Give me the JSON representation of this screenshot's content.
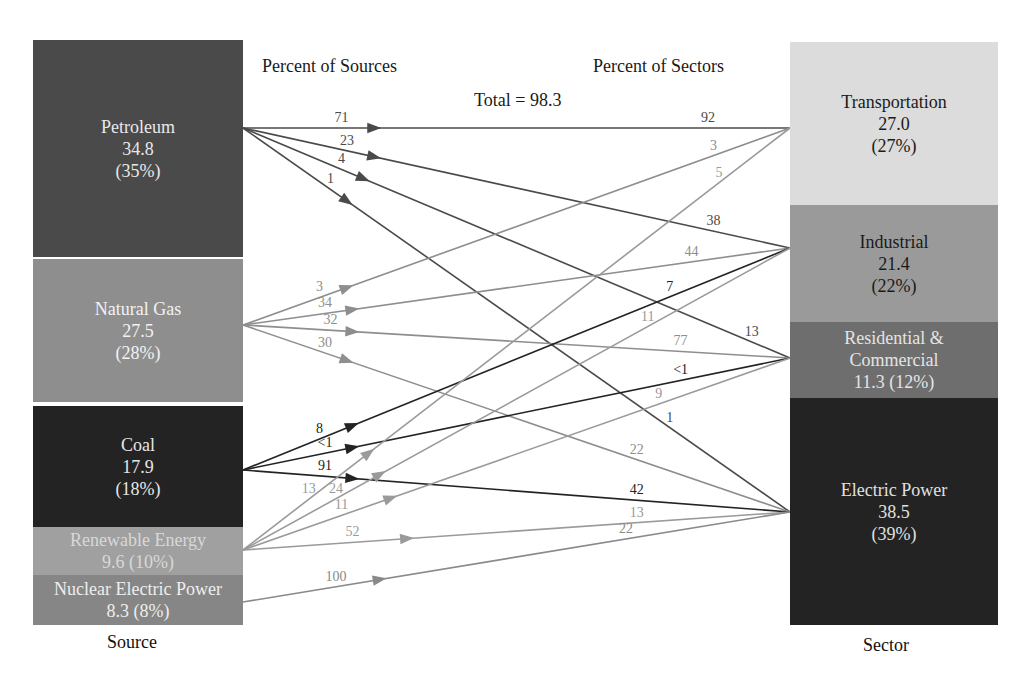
{
  "headings": {
    "percent_of_sources": "Percent of Sources",
    "percent_of_sectors": "Percent of Sectors",
    "total": "Total = 98.3"
  },
  "axis": {
    "source_label": "Source",
    "sector_label": "Sector"
  },
  "sources": [
    {
      "id": "petroleum",
      "name": "Petroleum",
      "value": "34.8",
      "percent": "(35%)",
      "lines": [
        "Petroleum",
        "34.8",
        "(35%)"
      ],
      "color": "#4a4a4a",
      "text_color": "#e8e8e8",
      "top": 40,
      "height": 217,
      "anchor_y": 128
    },
    {
      "id": "natural-gas",
      "name": "Natural Gas",
      "value": "27.5",
      "percent": "(28%)",
      "lines": [
        "Natural Gas",
        "27.5",
        "(28%)"
      ],
      "color": "#8e8e8e",
      "text_color": "#f2f2f2",
      "top": 259,
      "height": 143,
      "anchor_y": 325
    },
    {
      "id": "coal",
      "name": "Coal",
      "value": "17.9",
      "percent": "(18%)",
      "lines": [
        "Coal",
        "17.9",
        "(18%)"
      ],
      "color": "#232323",
      "text_color": "#e6e6e6",
      "top": 406,
      "height": 121,
      "anchor_y": 470
    },
    {
      "id": "renewable-energy",
      "name": "Renewable Energy",
      "value": "9.6",
      "percent": "(10%)",
      "lines": [
        "Renewable Energy",
        "9.6 (10%)"
      ],
      "color": "#a0a0a0",
      "text_color": "#d8d8d8",
      "top": 527,
      "height": 48,
      "anchor_y": 550
    },
    {
      "id": "nuclear-electric-power",
      "name": "Nuclear Electric Power",
      "value": "8.3",
      "percent": "(8%)",
      "lines": [
        "Nuclear Electric Power",
        "8.3 (8%)"
      ],
      "color": "#868686",
      "text_color": "#eeeeee",
      "top": 575,
      "height": 50,
      "anchor_y": 602
    }
  ],
  "sectors": [
    {
      "id": "transportation",
      "name": "Transportation",
      "value": "27.0",
      "percent": "(27%)",
      "lines": [
        "Transportation",
        "27.0",
        "(27%)"
      ],
      "color": "#dcdcdc",
      "text_color": "#1a1a1a",
      "top": 42,
      "height": 163,
      "anchor_y": 128
    },
    {
      "id": "industrial",
      "name": "Industrial",
      "value": "21.4",
      "percent": "(22%)",
      "lines": [
        "Industrial",
        "21.4",
        "(22%)"
      ],
      "color": "#9a9a9a",
      "text_color": "#1a1a1a",
      "top": 205,
      "height": 117,
      "anchor_y": 248
    },
    {
      "id": "residential-commercial",
      "name": "Residential & Commercial",
      "value": "11.3",
      "percent": "(12%)",
      "lines": [
        "Residential &",
        "Commercial",
        "11.3 (12%)"
      ],
      "color": "#6e6e6e",
      "text_color": "#e4e4e4",
      "top": 322,
      "height": 76,
      "anchor_y": 358
    },
    {
      "id": "electric-power",
      "name": "Electric Power",
      "value": "38.5",
      "percent": "(39%)",
      "lines": [
        "Electric Power",
        "38.5",
        "(39%)"
      ],
      "color": "#232323",
      "text_color": "#e0e0e0",
      "top": 398,
      "height": 227,
      "anchor_y": 512
    }
  ],
  "flows": [
    {
      "from": "petroleum",
      "to": "transportation",
      "pct_source": "71",
      "pct_sector": "92",
      "color": "#4a4a4a",
      "label_color": "#4a4a4a",
      "arrow_t": 0.24,
      "src_label_t": 0.18,
      "sec_label_t": 0.85
    },
    {
      "from": "petroleum",
      "to": "industrial",
      "pct_source": "23",
      "pct_sector": "38",
      "color": "#4a4a4a",
      "label_color": "#4a4a4a",
      "arrow_t": 0.24,
      "src_label_t": 0.19,
      "sec_label_t": 0.86
    },
    {
      "from": "petroleum",
      "to": "residential-commercial",
      "pct_source": "4",
      "pct_sector": "13",
      "color": "#4a4a4a",
      "label_color": "#4a4a4a",
      "arrow_t": 0.22,
      "src_label_t": 0.18,
      "sec_label_t": 0.93
    },
    {
      "from": "petroleum",
      "to": "electric-power",
      "pct_source": "1",
      "pct_sector": "1",
      "color": "#4a4a4a",
      "label_color": "#4a4a4a",
      "arrow_t": 0.19,
      "src_label_t": 0.16,
      "sec_label_t": 0.78
    },
    {
      "from": "natural-gas",
      "to": "transportation",
      "pct_source": "3",
      "pct_sector": "3",
      "color": "#8e8e8e",
      "label_color": "#8e8e8e",
      "arrow_t": 0.19,
      "src_label_t": 0.14,
      "sec_label_t": 0.86
    },
    {
      "from": "natural-gas",
      "to": "industrial",
      "pct_source": "34",
      "pct_sector": "44",
      "color": "#8e8e8e",
      "label_color": "#8e8e8e",
      "arrow_t": 0.2,
      "src_label_t": 0.15,
      "sec_label_t": 0.82
    },
    {
      "from": "natural-gas",
      "to": "residential-commercial",
      "pct_source": "32",
      "pct_sector": "77",
      "color": "#8e8e8e",
      "label_color": "#8e8e8e",
      "arrow_t": 0.2,
      "src_label_t": 0.16,
      "sec_label_t": 0.8
    },
    {
      "from": "natural-gas",
      "to": "electric-power",
      "pct_source": "30",
      "pct_sector": "22",
      "color": "#8e8e8e",
      "label_color": "#8e8e8e",
      "arrow_t": 0.19,
      "src_label_t": 0.15,
      "sec_label_t": 0.72
    },
    {
      "from": "coal",
      "to": "industrial",
      "pct_source": "8",
      "pct_sector": "7",
      "color": "#232323",
      "label_color": "#232323",
      "arrow_t": 0.2,
      "src_label_t": 0.14,
      "sec_label_t": 0.78
    },
    {
      "from": "coal",
      "to": "residential-commercial",
      "pct_source": "<1",
      "pct_sector": "<1",
      "color": "#232323",
      "label_color": "#232323",
      "arrow_t": 0.2,
      "src_label_t": 0.15,
      "sec_label_t": 0.8
    },
    {
      "from": "coal",
      "to": "electric-power",
      "pct_source": "91",
      "pct_sector": "42",
      "color": "#232323",
      "label_color": "#232323",
      "arrow_t": 0.2,
      "src_label_t": 0.15,
      "sec_label_t": 0.72
    },
    {
      "from": "renewable-energy",
      "to": "transportation",
      "pct_source": "13",
      "pct_sector": "5",
      "color": "#9a9a9a",
      "label_color": "#9a9a9a",
      "arrow_t": 0.23,
      "src_label_t": 0.12,
      "sec_label_t": 0.87
    },
    {
      "from": "renewable-energy",
      "to": "industrial",
      "pct_source": "24",
      "pct_sector": "11",
      "color": "#9a9a9a",
      "label_color": "#9a9a9a",
      "arrow_t": 0.25,
      "src_label_t": 0.17,
      "sec_label_t": 0.74
    },
    {
      "from": "renewable-energy",
      "to": "residential-commercial",
      "pct_source": "11",
      "pct_sector": "9",
      "color": "#9a9a9a",
      "label_color": "#9a9a9a",
      "arrow_t": 0.27,
      "src_label_t": 0.18,
      "sec_label_t": 0.76
    },
    {
      "from": "renewable-energy",
      "to": "electric-power",
      "pct_source": "52",
      "pct_sector": "13",
      "color": "#9a9a9a",
      "label_color": "#9a9a9a",
      "arrow_t": 0.3,
      "src_label_t": 0.2,
      "sec_label_t": 0.72
    },
    {
      "from": "nuclear-electric-power",
      "to": "electric-power",
      "pct_source": "100",
      "pct_sector": "22",
      "color": "#8a8a8a",
      "label_color": "#8a8a8a",
      "arrow_t": 0.25,
      "src_label_t": 0.17,
      "sec_label_t": 0.7
    }
  ],
  "layout": {
    "left_x": 33,
    "left_w": 210,
    "right_x": 790,
    "right_w": 208
  }
}
